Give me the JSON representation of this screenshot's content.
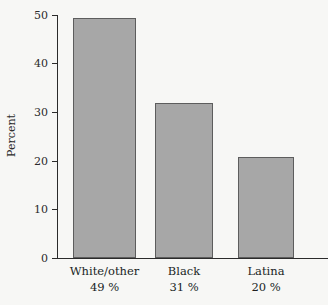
{
  "chart_data": {
    "type": "bar",
    "title": "",
    "subtitle": "",
    "xlabel": "",
    "ylabel": "Percent",
    "ylim": [
      0,
      50
    ],
    "grid": false,
    "legend": "none",
    "y_ticks": [
      "0",
      "10",
      "20",
      "30",
      "40",
      "50"
    ],
    "y_tick_values": [
      0,
      10,
      20,
      30,
      40,
      50
    ],
    "categories": [
      "White/other",
      "Black",
      "Latina"
    ],
    "category_sublabels": [
      "49 %",
      "31 %",
      "20 %"
    ],
    "values": [
      49.3,
      31.8,
      20.8
    ],
    "bars": [
      {
        "label": "White/other",
        "sublabel": "49 %",
        "value": 49.3
      },
      {
        "label": "Black",
        "sublabel": "31 %",
        "value": 31.8
      },
      {
        "label": "Latina",
        "sublabel": "20 %",
        "value": 20.8
      }
    ],
    "colors": {
      "background": "#f7f7f5",
      "bar_fill": "#a7a7a7",
      "bar_edge": "#5d5d5d",
      "axis": "#2b2b2b",
      "text": "#201f1f"
    }
  }
}
